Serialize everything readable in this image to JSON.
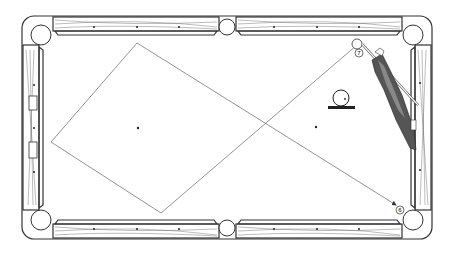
{
  "diagram": {
    "colors": {
      "line": "#333333",
      "path": "#777777",
      "wood": "#555555",
      "background": "#ffffff"
    },
    "balls": [
      {
        "label": "7",
        "name": "object-ball-7"
      },
      {
        "label": "6",
        "name": "object-ball-6"
      }
    ],
    "shot_path_points": [
      [
        357,
        45
      ],
      [
        161,
        213
      ],
      [
        51,
        142
      ],
      [
        137,
        43
      ],
      [
        396,
        205
      ]
    ]
  }
}
